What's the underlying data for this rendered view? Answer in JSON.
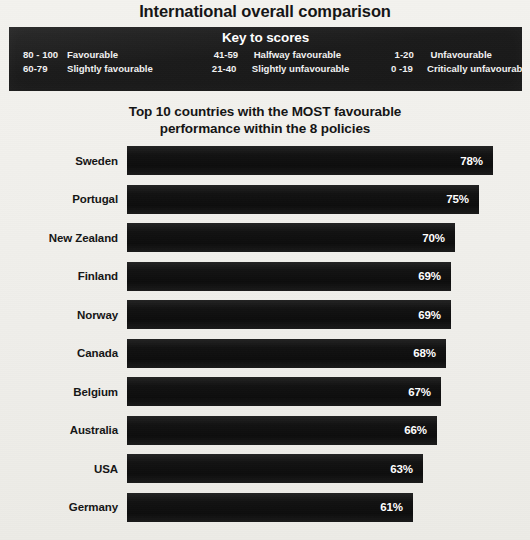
{
  "header": {
    "main_title": "International overall comparison"
  },
  "key_to_scores": {
    "title": "Key to scores",
    "entries": [
      {
        "range": "80 - 100",
        "label": "Favourable",
        "column": 1,
        "row": 1
      },
      {
        "range": "41-59",
        "label": "Halfway favourable",
        "column": 2,
        "row": 1
      },
      {
        "range": "1-20",
        "label": "Unfavourable",
        "column": 3,
        "row": 1
      },
      {
        "range": "60-79",
        "label": "Slightly favourable",
        "column": 1,
        "row": 2
      },
      {
        "range": "21-40",
        "label": "Slightly unfavourable",
        "column": 2,
        "row": 2
      },
      {
        "range": "0 -19",
        "label": "Critically unfavourable",
        "column": 3,
        "row": 2
      }
    ]
  },
  "chart_data": {
    "type": "bar",
    "orientation": "horizontal",
    "title": "Top 10 countries with the MOST favourable performance within the 8 policies",
    "title_line1": "Top 10 countries with the MOST favourable",
    "title_line2": "performance within the 8 policies",
    "xlabel": "",
    "ylabel": "",
    "xlim": [
      0,
      78
    ],
    "grid": false,
    "legend": "none",
    "value_suffix": "%",
    "bar_color": "#141414",
    "value_label_color": "#ffffff",
    "background_color": "#f1f0ec",
    "categories": [
      "Sweden",
      "Portugal",
      "New Zealand",
      "Finland",
      "Norway",
      "Canada",
      "Belgium",
      "Australia",
      "USA",
      "Germany"
    ],
    "values": [
      78,
      75,
      70,
      69,
      69,
      68,
      67,
      66,
      63,
      61
    ],
    "value_labels": [
      "78%",
      "75%",
      "70%",
      "69%",
      "69%",
      "68%",
      "67%",
      "66%",
      "63%",
      "61%"
    ]
  }
}
